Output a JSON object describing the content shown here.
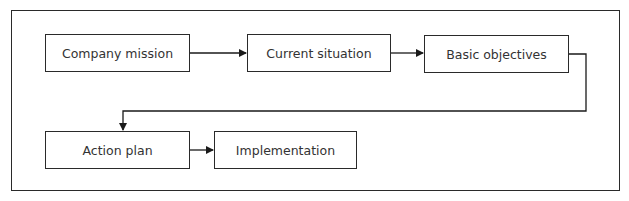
{
  "diagram": {
    "type": "flowchart",
    "nodes": [
      {
        "id": "mission",
        "label": "Company mission"
      },
      {
        "id": "situation",
        "label": "Current situation"
      },
      {
        "id": "objectives",
        "label": "Basic objectives"
      },
      {
        "id": "action",
        "label": "Action plan"
      },
      {
        "id": "implementation",
        "label": "Implementation"
      }
    ],
    "edges": [
      {
        "from": "mission",
        "to": "situation"
      },
      {
        "from": "situation",
        "to": "objectives"
      },
      {
        "from": "objectives",
        "to": "action"
      },
      {
        "from": "action",
        "to": "implementation"
      }
    ]
  }
}
